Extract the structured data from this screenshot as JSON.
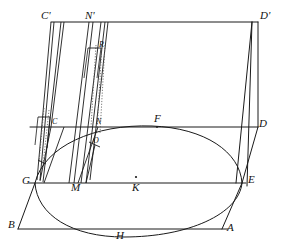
{
  "figure": {
    "stroke_color": "#1a1a1a",
    "dotted_color": "#555555",
    "background": "#ffffff",
    "width": 281,
    "height": 250
  },
  "labels": [
    {
      "id": "label-C-prime",
      "text": "C'",
      "x": 41,
      "y": 10,
      "size": "normal"
    },
    {
      "id": "label-N-prime",
      "text": "N'",
      "x": 85,
      "y": 10,
      "size": "normal"
    },
    {
      "id": "label-D-prime",
      "text": "D'",
      "x": 260,
      "y": 10,
      "size": "normal"
    },
    {
      "id": "label-R",
      "text": "R",
      "x": 99,
      "y": 41,
      "size": "small"
    },
    {
      "id": "label-C",
      "text": "C",
      "x": 52,
      "y": 118,
      "size": "small"
    },
    {
      "id": "label-N",
      "text": "N",
      "x": 96,
      "y": 118,
      "size": "small"
    },
    {
      "id": "label-F",
      "text": "F",
      "x": 154,
      "y": 113,
      "size": "normal"
    },
    {
      "id": "label-D",
      "text": "D",
      "x": 259,
      "y": 118,
      "size": "normal"
    },
    {
      "id": "label-O",
      "text": "O",
      "x": 93,
      "y": 137,
      "size": "small"
    },
    {
      "id": "label-G",
      "text": "G",
      "x": 22,
      "y": 175,
      "size": "normal"
    },
    {
      "id": "label-M",
      "text": "M",
      "x": 71,
      "y": 182,
      "size": "normal"
    },
    {
      "id": "label-K",
      "text": "K",
      "x": 132,
      "y": 182,
      "size": "normal"
    },
    {
      "id": "label-E",
      "text": "E",
      "x": 248,
      "y": 174,
      "size": "normal"
    },
    {
      "id": "label-B",
      "text": "B",
      "x": 8,
      "y": 219,
      "size": "normal"
    },
    {
      "id": "label-H",
      "text": "H",
      "x": 116,
      "y": 230,
      "size": "normal"
    },
    {
      "id": "label-A",
      "text": "A",
      "x": 227,
      "y": 222,
      "size": "normal"
    }
  ],
  "points": {
    "C_prime": {
      "x": 51,
      "y": 22
    },
    "N_prime": {
      "x": 96,
      "y": 22
    },
    "D_prime": {
      "x": 258,
      "y": 22
    },
    "C": {
      "x": 51,
      "y": 127
    },
    "N": {
      "x": 98,
      "y": 127
    },
    "F": {
      "x": 157,
      "y": 127
    },
    "D": {
      "x": 258,
      "y": 127
    },
    "G": {
      "x": 35,
      "y": 183
    },
    "M": {
      "x": 78,
      "y": 183
    },
    "K": {
      "x": 136,
      "y": 183
    },
    "E": {
      "x": 242,
      "y": 183
    },
    "B": {
      "x": 18,
      "y": 229
    },
    "H": {
      "x": 122,
      "y": 233
    },
    "A": {
      "x": 222,
      "y": 229
    },
    "O": {
      "x": 95,
      "y": 145
    },
    "R": {
      "x": 98,
      "y": 48
    }
  },
  "segments": {
    "top_rail": "C'-D' horizontal top edge",
    "middle_rail": "C-F-D horizontal middle edge",
    "base_rail": "G-M-K-E horizontal base edge",
    "bottom_rail": "B-H-A horizontal bottom edge",
    "left_slant": "G-B left slanted edge",
    "right_slant": "E-A right slanted edge",
    "right_upright": "D'-D-E right vertical edge"
  },
  "curves": {
    "upper_ellipse_arc": "arc through G, F, E (top of ellipse)",
    "lower_ellipse_arc": "arc through G, H, E (bottom of ellipse)"
  },
  "center_dot": {
    "x": 136,
    "y": 177
  },
  "tick_marks": [
    {
      "id": "tick-near-C",
      "x1": 38,
      "y1": 117,
      "x2": 50,
      "y2": 117
    },
    {
      "id": "tick-near-R",
      "x1": 88,
      "y1": 48,
      "x2": 101,
      "y2": 48
    }
  ]
}
